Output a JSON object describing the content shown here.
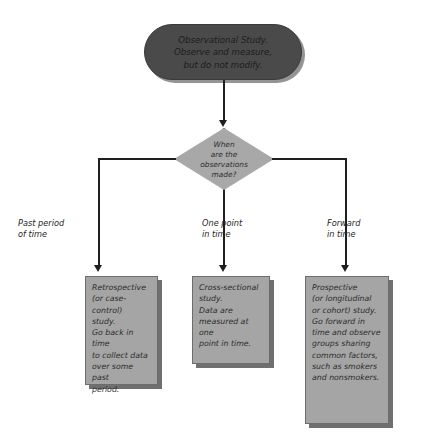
{
  "diagram": {
    "type": "flowchart",
    "colors": {
      "top_node_fill": "#4a4a4a",
      "decision_fill": "#a8a8a8",
      "outcome_fill": "#a5a5a5",
      "outline": "#6d6d6d",
      "connector": "#1f1f1f",
      "background": "#ffffff"
    },
    "top_node": {
      "shape": "stadium",
      "lines": [
        "Observational Study.",
        "Observe and measure,",
        "but do not modify."
      ]
    },
    "decision": {
      "shape": "diamond",
      "lines": [
        "When",
        "are the",
        "observations",
        "made?"
      ]
    },
    "branches": [
      {
        "id": "left",
        "label_lines": [
          "Past period",
          "of time"
        ],
        "outcome_lines": [
          "Retrospective",
          "(or case-control)",
          "study.",
          "Go back in time",
          "to collect data",
          "over some past",
          "period."
        ]
      },
      {
        "id": "middle",
        "label_lines": [
          "One point",
          "in time"
        ],
        "outcome_lines": [
          "Cross-sectional",
          "study.",
          "Data are",
          "measured at one",
          "point in time."
        ]
      },
      {
        "id": "right",
        "label_lines": [
          "Forward",
          "in time"
        ],
        "outcome_lines": [
          "Prospective",
          "(or longitudinal",
          "or cohort) study.",
          "Go forward in",
          "time and observe",
          "groups sharing",
          "common factors,",
          "such as smokers",
          "and nonsmokers."
        ]
      }
    ]
  }
}
